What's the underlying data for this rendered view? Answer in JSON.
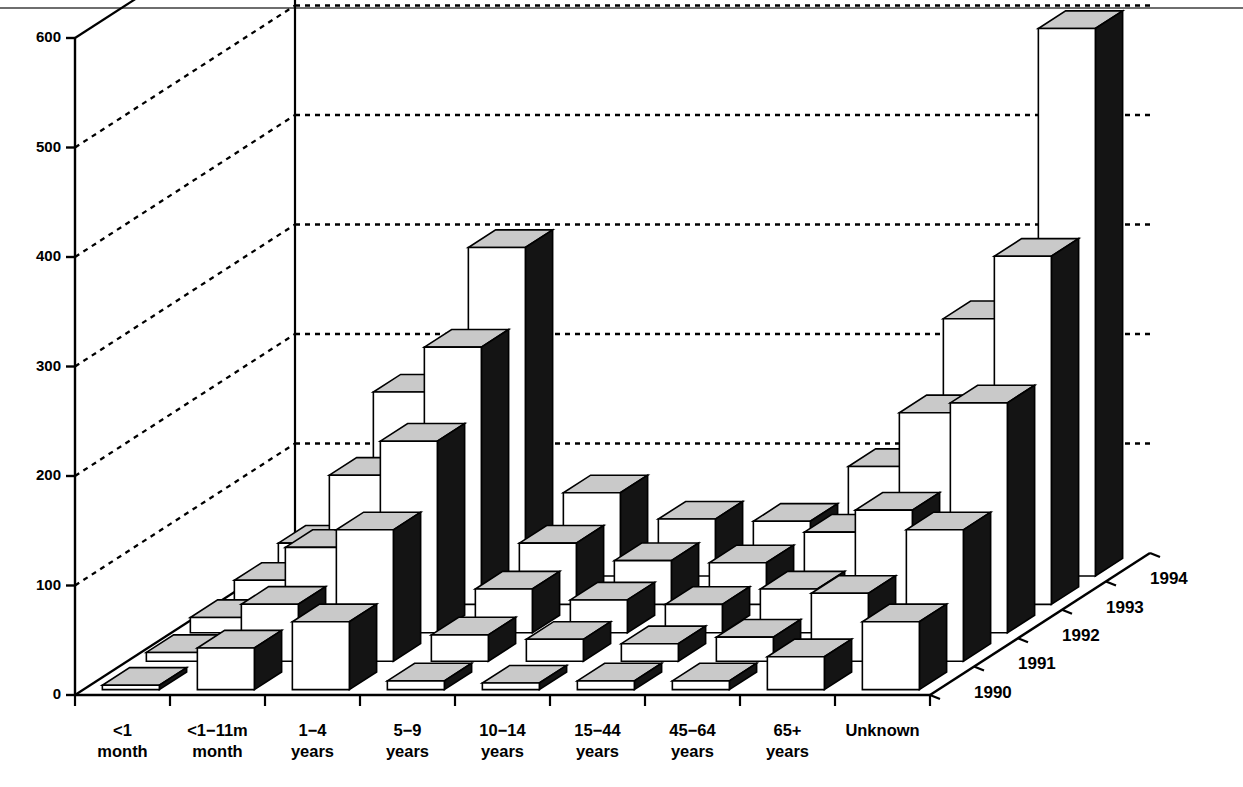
{
  "chart_data": {
    "type": "bar",
    "subtype": "3d-grouped-bar",
    "title": "",
    "subtitle": "",
    "xlabel": "",
    "ylabel": "",
    "zlabel": "",
    "grid": true,
    "legend_position": "depth-axis-right",
    "ylim": [
      0,
      600
    ],
    "ytick_labels": [
      "0",
      "100",
      "200",
      "300",
      "400",
      "500",
      "600"
    ],
    "yticks": [
      0,
      100,
      200,
      300,
      400,
      500,
      600
    ],
    "categories": [
      "<1\nmonth",
      "<1−11m\nmonth",
      "1−4\nyears",
      "5−9\nyears",
      "10−14\nyears",
      "15−44\nyears",
      "45−64\nyears",
      "65+\nyears",
      "Unknown"
    ],
    "category_lines": [
      [
        "<1",
        "month"
      ],
      [
        "<1−11m",
        "month"
      ],
      [
        "1−4",
        "years"
      ],
      [
        "5−9",
        "years"
      ],
      [
        "10−14",
        "years"
      ],
      [
        "15−44",
        "years"
      ],
      [
        "45−64",
        "years"
      ],
      [
        "65+",
        "years"
      ],
      [
        "Unknown",
        ""
      ]
    ],
    "depth_labels": [
      "1990",
      "1991",
      "1992",
      "1993",
      "1994"
    ],
    "series": [
      {
        "name": "1990",
        "values": [
          4,
          38,
          62,
          8,
          6,
          8,
          8,
          30,
          62
        ]
      },
      {
        "name": "1991",
        "values": [
          8,
          52,
          120,
          24,
          20,
          16,
          22,
          62,
          120
        ]
      },
      {
        "name": "1992",
        "values": [
          14,
          78,
          175,
          40,
          30,
          26,
          40,
          112,
          210
        ]
      },
      {
        "name": "1993",
        "values": [
          22,
          118,
          235,
          56,
          40,
          38,
          66,
          175,
          318
        ]
      },
      {
        "name": "1994",
        "values": [
          30,
          168,
          300,
          76,
          52,
          50,
          100,
          235,
          500
        ]
      }
    ],
    "colors": {
      "bar_front": "#ffffff",
      "bar_top": "#c9c9c9",
      "bar_side": "#141414",
      "outline": "#000000",
      "axis": "#000000",
      "grid": "#000000",
      "background": "#ffffff",
      "top_rule": "#6e6e6e"
    }
  }
}
